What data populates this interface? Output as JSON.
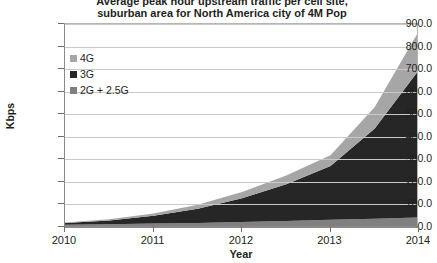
{
  "chart_data": {
    "type": "area",
    "stacked": true,
    "title": "Average peak hour upstream traffic per cell site, suburban area for North America city of 4M Pop",
    "title_lines": [
      "Average peak hour upstream traffic per cell site,",
      "suburban area for North America city of 4M Pop"
    ],
    "xlabel": "Year",
    "ylabel": "Kbps",
    "x": [
      2010,
      2011,
      2012,
      2013,
      2014
    ],
    "categories": [
      "2010",
      "2011",
      "2012",
      "2013",
      "2014"
    ],
    "xlim": [
      2010,
      2014
    ],
    "ylim": [
      0,
      900
    ],
    "ytick_values": [
      0,
      100,
      200,
      300,
      400,
      500,
      600,
      700,
      800,
      900
    ],
    "ytick_labels": [
      "0.0",
      "100.0",
      "200.0",
      "300.0",
      "400.0",
      "500.0",
      "600.0",
      "700.0",
      "800.0",
      "900.0"
    ],
    "xtick_labels": [
      "2010",
      "2011",
      "2012",
      "2013",
      "2014"
    ],
    "grid": true,
    "grid_axis": "y",
    "legend_position": "upper-left-inside",
    "series": [
      {
        "name": "2G + 2.5G",
        "color": "#808080",
        "values": [
          10,
          15,
          22,
          32,
          42
        ],
        "dense_x": [
          2010,
          2010.5,
          2011,
          2011.5,
          2012,
          2012.5,
          2013,
          2013.5,
          2014
        ],
        "dense_values": [
          10,
          12,
          15,
          18,
          22,
          27,
          32,
          37,
          42
        ]
      },
      {
        "name": "3G",
        "color": "#262626",
        "values": [
          8,
          35,
          105,
          238,
          655
        ],
        "dense_x": [
          2010,
          2010.5,
          2011,
          2011.5,
          2012,
          2012.5,
          2013,
          2013.5,
          2014
        ],
        "dense_values": [
          8,
          17,
          35,
          63,
          105,
          163,
          238,
          400,
          655
        ]
      },
      {
        "name": "4G",
        "color": "#a6a6a6",
        "values": [
          2,
          10,
          28,
          48,
          173
        ],
        "dense_x": [
          2010,
          2010.5,
          2011,
          2011.5,
          2012,
          2012.5,
          2013,
          2013.5,
          2014
        ],
        "dense_values": [
          2,
          5,
          10,
          18,
          28,
          38,
          48,
          95,
          173
        ]
      }
    ],
    "stack_totals": [
      20,
      60,
      155,
      302,
      870
    ],
    "colors": {
      "4G": "#a6a6a6",
      "3G": "#262626",
      "2G + 2.5G": "#808080",
      "grid": "#c9c9c9",
      "axis": "#8a8a8a",
      "text": "#231f20",
      "background": "#ffffff"
    }
  },
  "legend": {
    "items": [
      {
        "label": "4G",
        "color": "#a6a6a6"
      },
      {
        "label": "3G",
        "color": "#262626"
      },
      {
        "label": "2G + 2.5G",
        "color": "#808080"
      }
    ]
  }
}
